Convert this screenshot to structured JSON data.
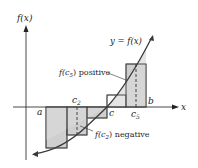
{
  "diagram": {
    "type": "riemann-sum-illustration",
    "labels": {
      "y_axis": "f(x)",
      "x_axis": "x",
      "curve": "y = f(x)",
      "a": "a",
      "b": "b",
      "c": "c",
      "c2": "c",
      "c2_sub": "2",
      "c5": "c",
      "c5_sub": "5",
      "positive_annotation_prefix": "f(c",
      "positive_annotation_sub": "5",
      "positive_annotation_suffix": ") positive",
      "negative_annotation_prefix": "f(c",
      "negative_annotation_sub": "2",
      "negative_annotation_suffix": ") negative"
    },
    "colors": {
      "shade": "#cfcfcf",
      "stroke": "#333333",
      "curve": "#3a3a3a"
    },
    "subintervals": 5
  }
}
